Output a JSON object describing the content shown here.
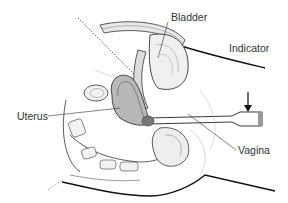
{
  "figure": {
    "labels": {
      "bladder": "Bladder",
      "indicator": "Indicator",
      "uterus": "Uterus",
      "vagina": "Vagina"
    },
    "colors": {
      "line": "#222222",
      "shade": "#9a9a9a",
      "light_shade": "#d8d8d8",
      "background": "#ffffff"
    }
  }
}
